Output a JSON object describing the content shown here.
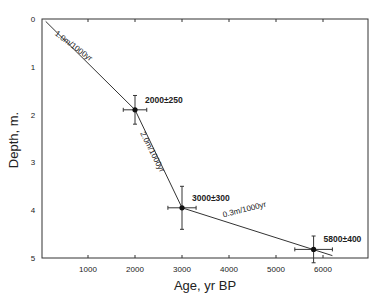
{
  "chart_data": {
    "type": "line",
    "title": "",
    "xlabel": "Age, yr BP",
    "ylabel": "Depth, m.",
    "xlim": [
      0,
      7000
    ],
    "ylim": [
      0,
      5
    ],
    "y_inverted": true,
    "grid": false,
    "x_ticks": [
      1000,
      2000,
      3000,
      4000,
      5000,
      6000
    ],
    "x_tick_labels": [
      "1000",
      "2000",
      "3000",
      "4000",
      "5000",
      "6000"
    ],
    "y_ticks": [
      0,
      1,
      2,
      3,
      4,
      5
    ],
    "y_tick_labels": [
      "0",
      "1",
      "2",
      "3",
      "4",
      "5"
    ],
    "points": [
      {
        "age": 2000,
        "depth": 1.9,
        "age_err": 250,
        "depth_err": 0.3,
        "label": "2000±250"
      },
      {
        "age": 3000,
        "depth": 3.95,
        "age_err": 300,
        "depth_err": 0.45,
        "label": "3000±300"
      },
      {
        "age": 5800,
        "depth": 4.82,
        "age_err": 400,
        "depth_err": 0.28,
        "label": "5800±400"
      }
    ],
    "segments": [
      {
        "from": [
          100,
          0.05
        ],
        "to": [
          2000,
          1.9
        ],
        "label": "1.0m/1000yr"
      },
      {
        "from": [
          2000,
          1.9
        ],
        "to": [
          3000,
          3.95
        ],
        "label": "2.0m/1000yr"
      },
      {
        "from": [
          3000,
          3.95
        ],
        "to": [
          6200,
          4.95
        ],
        "label": "0.3m/1000yr"
      }
    ]
  }
}
